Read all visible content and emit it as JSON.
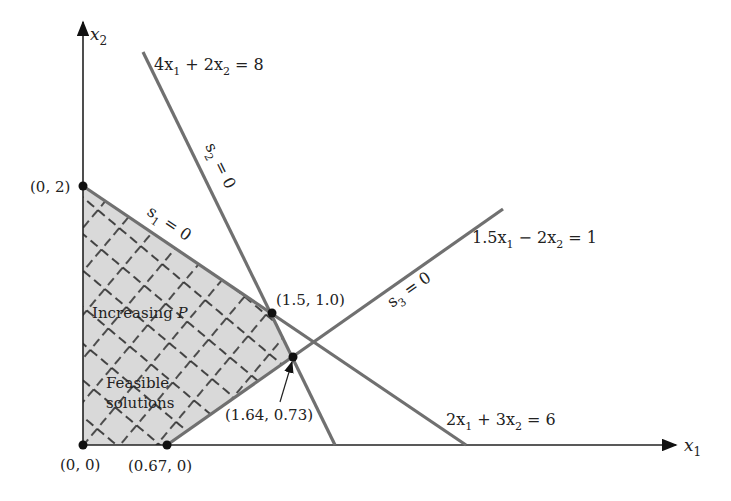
{
  "axes": {
    "x_label": "x",
    "x_sub": "1",
    "y_label": "x",
    "y_sub": "2"
  },
  "constraints": [
    {
      "id": "c1",
      "equation": "2x1 + 3x2 = 6",
      "parts": [
        "2x",
        "1",
        " + 3x",
        "2",
        " = 6"
      ],
      "slack_label": "s1 = 0",
      "slack_parts": [
        "s",
        "1",
        " = 0"
      ]
    },
    {
      "id": "c2",
      "equation": "4x1 + 2x2 = 8",
      "parts": [
        "4x",
        "1",
        " + 2x",
        "2",
        " = 8"
      ],
      "slack_label": "s2 = 0",
      "slack_parts": [
        "s",
        "2",
        " = 0"
      ]
    },
    {
      "id": "c3",
      "equation": "1.5x1 - 2x2 = 1",
      "parts": [
        "1.5x",
        "1",
        " − 2x",
        "2",
        " = 1"
      ],
      "slack_label": "s3 = 0",
      "slack_parts": [
        "s",
        "3",
        " = 0"
      ]
    }
  ],
  "vertices": [
    {
      "label": "(0, 0)",
      "x1": 0,
      "x2": 0
    },
    {
      "label": "(0.67, 0)",
      "x1": 0.67,
      "x2": 0
    },
    {
      "label": "(1.64, 0.73)",
      "x1": 1.64,
      "x2": 0.73
    },
    {
      "label": "(1.5, 1.0)",
      "x1": 1.5,
      "x2": 1.0
    },
    {
      "label": "(0, 2)",
      "x1": 0,
      "x2": 2
    }
  ],
  "region": {
    "increasing_label": "Increasing",
    "increasing_var": "P",
    "feasible_line1": "Feasible",
    "feasible_line2": "solutions",
    "fill_color": "#d9d9d9",
    "line_color": "#707070"
  }
}
